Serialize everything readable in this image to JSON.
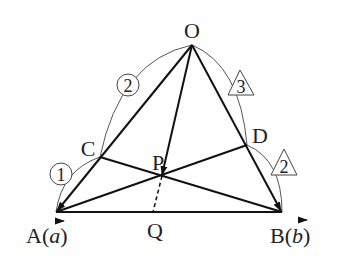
{
  "diagram": {
    "points": {
      "O": {
        "label": "O",
        "x": 192,
        "y": 45
      },
      "A": {
        "label": "A(a)",
        "x": 56,
        "y": 212
      },
      "B": {
        "label": "B(b)",
        "x": 282,
        "y": 212
      },
      "C": {
        "label": "C",
        "x": 100,
        "y": 157
      },
      "D": {
        "label": "D",
        "x": 247,
        "y": 145
      },
      "P": {
        "label": "P",
        "x": 162,
        "y": 176
      },
      "Q": {
        "label": "Q",
        "x": 153,
        "y": 212
      }
    },
    "labels": {
      "O": "O",
      "A": "A(",
      "A_vec": "a",
      "A_close": ")",
      "B": "B(",
      "B_vec": "b",
      "B_close": ")",
      "C": "C",
      "D": "D",
      "P": "P",
      "Q": "Q"
    },
    "ratios": {
      "OC": "2",
      "CA": "1",
      "OD": "3",
      "DB": "2"
    },
    "ratio_markers": {
      "OC": "circle",
      "CA": "circle",
      "OD": "triangle",
      "DB": "triangle"
    },
    "segments": [
      {
        "from": "O",
        "to": "A",
        "style": "arrow"
      },
      {
        "from": "O",
        "to": "B",
        "style": "arrow"
      },
      {
        "from": "O",
        "to": "P",
        "style": "arrow"
      },
      {
        "from": "A",
        "to": "B",
        "style": "solid"
      },
      {
        "from": "A",
        "to": "D",
        "style": "solid"
      },
      {
        "from": "B",
        "to": "C",
        "style": "solid"
      },
      {
        "from": "P",
        "to": "Q",
        "style": "dashed"
      }
    ]
  }
}
